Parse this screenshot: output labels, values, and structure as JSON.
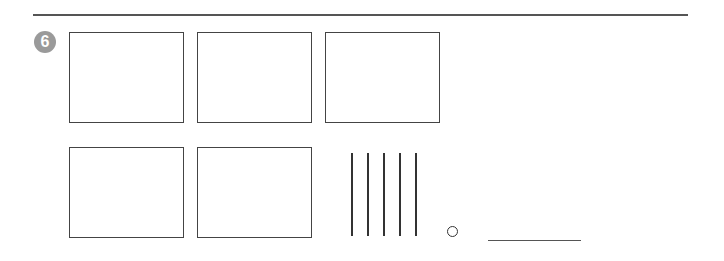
{
  "problem": {
    "number": "6",
    "badge_color": "#9a9a9a"
  },
  "boxes": {
    "top_row_count": 3,
    "bottom_row_count": 2
  },
  "tally_marks": {
    "count": 5
  },
  "answer": {
    "value": ""
  }
}
